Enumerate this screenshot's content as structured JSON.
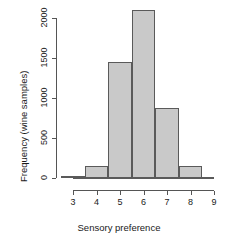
{
  "chart_data": {
    "type": "bar",
    "title": "",
    "subtitle": "",
    "xlabel": "Sensory preference",
    "ylabel": "Frequency (wine samples)",
    "categories": [
      "3",
      "4",
      "5",
      "6",
      "7",
      "8"
    ],
    "values": [
      25,
      150,
      1450,
      2100,
      875,
      150
    ],
    "bin_edges": [
      2.5,
      3.5,
      4.5,
      5.5,
      6.5,
      7.5,
      8.5
    ],
    "bin_width": 1,
    "xlim": [
      3,
      9
    ],
    "ylim": [
      0,
      2200
    ],
    "xticks": [
      "3",
      "4",
      "5",
      "6",
      "7",
      "8",
      "9"
    ],
    "xtick_values": [
      3,
      4,
      5,
      6,
      7,
      8,
      9
    ],
    "yticks": [
      "0",
      "500",
      "1000",
      "1500",
      "2000"
    ],
    "ytick_values": [
      0,
      500,
      1000,
      1500,
      2000
    ],
    "grid": false,
    "legend": null,
    "bar_fill_color": "#c9c9c9",
    "bar_border_color": "#5a5a5a",
    "axis_color": "#555555"
  }
}
